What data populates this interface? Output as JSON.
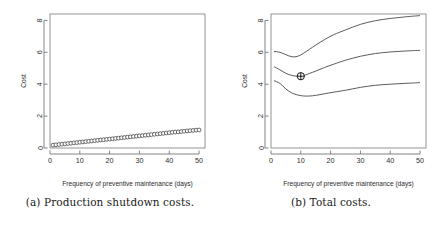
{
  "figure": {
    "panels": [
      {
        "id": "a",
        "caption": "(a) Production shutdown costs.",
        "chart_ref": 0
      },
      {
        "id": "b",
        "caption": "(b) Total costs.",
        "chart_ref": 1
      }
    ]
  },
  "chart_data": [
    {
      "type": "scatter",
      "panel": "a",
      "title": "",
      "xlabel": "Frequency of preventive maintenance (days)",
      "ylabel": "Cost",
      "xlim": [
        0,
        52
      ],
      "ylim": [
        0,
        8.4
      ],
      "xticks": [
        0,
        10,
        20,
        30,
        40,
        50
      ],
      "yticks": [
        0,
        2,
        4,
        6,
        8
      ],
      "xticklabels": [
        "0",
        "10",
        "20",
        "30",
        "40",
        "50"
      ],
      "yticklabels": [
        "0",
        "2",
        "4",
        "6",
        "8"
      ],
      "grid": false,
      "legend": null,
      "marker": "open-circle",
      "series": [
        {
          "name": "Production shutdown cost",
          "x": [
            1,
            2,
            3,
            4,
            5,
            6,
            7,
            8,
            9,
            10,
            11,
            12,
            13,
            14,
            15,
            16,
            17,
            18,
            19,
            20,
            21,
            22,
            23,
            24,
            25,
            26,
            27,
            28,
            29,
            30,
            31,
            32,
            33,
            34,
            35,
            36,
            37,
            38,
            39,
            40,
            41,
            42,
            43,
            44,
            45,
            46,
            47,
            48,
            49,
            50
          ],
          "y": [
            0.18,
            0.2,
            0.22,
            0.24,
            0.26,
            0.28,
            0.3,
            0.32,
            0.34,
            0.36,
            0.38,
            0.4,
            0.42,
            0.44,
            0.46,
            0.48,
            0.5,
            0.52,
            0.54,
            0.56,
            0.58,
            0.6,
            0.62,
            0.64,
            0.66,
            0.68,
            0.7,
            0.72,
            0.74,
            0.76,
            0.78,
            0.8,
            0.82,
            0.84,
            0.86,
            0.88,
            0.9,
            0.92,
            0.94,
            0.96,
            0.98,
            1.0,
            1.01,
            1.03,
            1.05,
            1.07,
            1.09,
            1.1,
            1.12,
            1.13
          ]
        }
      ]
    },
    {
      "type": "line",
      "panel": "b",
      "title": "",
      "xlabel": "Frequency of preventive maintenance (days)",
      "ylabel": "Cost",
      "xlim": [
        0,
        52
      ],
      "ylim": [
        0,
        8.4
      ],
      "xticks": [
        0,
        10,
        20,
        30,
        40,
        50
      ],
      "yticks": [
        0,
        2,
        4,
        6,
        8
      ],
      "xticklabels": [
        "0",
        "10",
        "20",
        "30",
        "40",
        "50"
      ],
      "yticklabels": [
        "0",
        "2",
        "4",
        "6",
        "8"
      ],
      "grid": false,
      "legend": null,
      "annotation": {
        "label": "optimum",
        "marker": "circle-plus",
        "x": 10,
        "y": 4.5
      },
      "series": [
        {
          "name": "Upper confidence bound",
          "x": [
            1,
            3,
            5,
            7,
            9,
            11,
            13,
            15,
            18,
            21,
            25,
            30,
            35,
            40,
            45,
            50
          ],
          "y": [
            6.05,
            6.0,
            5.85,
            5.72,
            5.75,
            5.95,
            6.2,
            6.45,
            6.8,
            7.1,
            7.4,
            7.75,
            7.98,
            8.12,
            8.22,
            8.3
          ]
        },
        {
          "name": "Expected total cost",
          "x": [
            1,
            3,
            5,
            7,
            9,
            11,
            13,
            15,
            18,
            21,
            25,
            30,
            35,
            40,
            45,
            50
          ],
          "y": [
            5.1,
            4.9,
            4.68,
            4.55,
            4.5,
            4.55,
            4.68,
            4.82,
            5.05,
            5.25,
            5.5,
            5.75,
            5.92,
            6.02,
            6.08,
            6.12
          ]
        },
        {
          "name": "Lower confidence bound",
          "x": [
            1,
            3,
            5,
            7,
            9,
            11,
            13,
            15,
            18,
            21,
            25,
            30,
            35,
            40,
            45,
            50
          ],
          "y": [
            4.22,
            4.05,
            3.7,
            3.45,
            3.32,
            3.26,
            3.26,
            3.3,
            3.4,
            3.5,
            3.62,
            3.8,
            3.93,
            4.0,
            4.05,
            4.1
          ]
        }
      ]
    }
  ]
}
